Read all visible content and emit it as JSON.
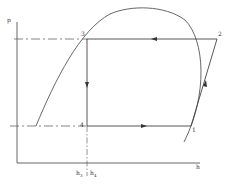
{
  "diagram": {
    "type": "pressure-enthalpy (p-h) refrigeration cycle",
    "axes": {
      "y_label": "p",
      "x_label": "h"
    },
    "points": [
      {
        "id": "1",
        "label": "1"
      },
      {
        "id": "2",
        "label": "2"
      },
      {
        "id": "3",
        "label": "3"
      },
      {
        "id": "4",
        "label": "4"
      }
    ],
    "x_marks": [
      {
        "label": "h",
        "sub": "3"
      },
      {
        "label": "h",
        "sub": "4"
      }
    ],
    "colors": {
      "line": "#555555",
      "background": "#ffffff"
    }
  }
}
